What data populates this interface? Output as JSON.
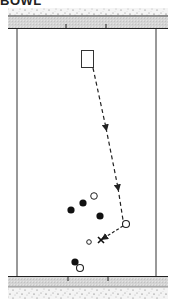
{
  "title": "BOWL",
  "diagram": {
    "type": "play-diagram",
    "field": {
      "top_band": {
        "gravel_y": [
          8,
          16
        ],
        "rail_y": [
          16,
          28
        ]
      },
      "bottom_band": {
        "rail_y": [
          276,
          287
        ],
        "gravel_y": [
          287,
          299
        ]
      },
      "side_lines_x": [
        17,
        156
      ],
      "tick_marks_top_x": [
        66,
        106
      ],
      "tick_marks_bottom_x": [
        68,
        108
      ]
    },
    "target_box": {
      "x": 81,
      "y": 50,
      "w": 12,
      "h": 17
    },
    "path": {
      "style": "dashed",
      "points": [
        [
          93,
          68
        ],
        [
          117,
          180
        ],
        [
          124,
          222
        ]
      ],
      "arrows_at": [
        [
          106,
          127
        ],
        [
          118,
          188
        ]
      ]
    },
    "pass_arrow": {
      "from": [
        124,
        224
      ],
      "to": [
        102,
        238
      ],
      "style": "dashed"
    },
    "x_marker": {
      "x": 101,
      "y": 240,
      "label": "×"
    },
    "filled_circles": [
      {
        "x": 83,
        "y": 203
      },
      {
        "x": 71,
        "y": 210
      },
      {
        "x": 100,
        "y": 216
      },
      {
        "x": 75,
        "y": 262
      }
    ],
    "open_circles": [
      {
        "x": 94,
        "y": 196,
        "r": 3.5
      },
      {
        "x": 126,
        "y": 224,
        "r": 3.5
      },
      {
        "x": 89,
        "y": 242,
        "r": 2.5
      },
      {
        "x": 80,
        "y": 268,
        "r": 3.5
      }
    ],
    "colors": {
      "line": "#222222",
      "rail": "#d6d6d6",
      "gravel": "#f2f2f2",
      "background": "#ffffff"
    }
  }
}
